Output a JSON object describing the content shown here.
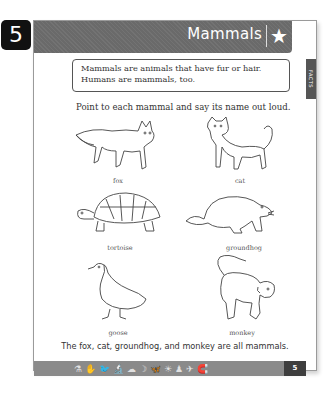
{
  "lesson_number": "5",
  "header": {
    "title": "Mammals",
    "icon": "star-icon"
  },
  "side_tab": {
    "label": "FACTS"
  },
  "fact_box": {
    "line1": "Mammals are animals that have fur or hair.",
    "line2": "Humans are mammals, too."
  },
  "instruction": "Point to each mammal and say its name out loud.",
  "animals": [
    {
      "name": "fox"
    },
    {
      "name": "cat"
    },
    {
      "name": "tortoise"
    },
    {
      "name": "groundhog"
    },
    {
      "name": "goose"
    },
    {
      "name": "monkey"
    }
  ],
  "summary": "The fox, cat, groundhog, and monkey are all mammals.",
  "footer": {
    "icons": [
      "test-tube-icon",
      "hand-icon",
      "bird-icon",
      "microscope-icon",
      "cloud-icon",
      "moon-icon",
      "butterfly-icon",
      "sun-icon",
      "figure-icon",
      "plane-icon",
      "magnet-icon"
    ],
    "icon_glyphs": [
      "⚗",
      "✋",
      "🐦",
      "🔬",
      "☁",
      "☽",
      "🦋",
      "☀",
      "♟",
      "✈",
      "🧲"
    ],
    "page_number": "5"
  }
}
